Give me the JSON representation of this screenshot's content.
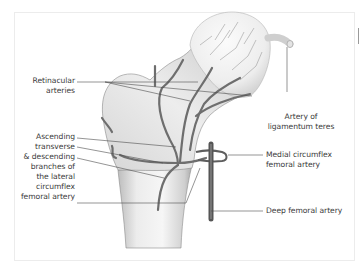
{
  "figure": {
    "labels": {
      "retinacular": [
        "Retinacular",
        "arteries"
      ],
      "ascending": "Ascending",
      "transverse": "transverse",
      "descending_block": [
        "& descending",
        "branches of",
        "the lateral",
        "circumflex"
      ],
      "lateral_circumflex_last": "femoral artery",
      "ligamentum_teres": [
        "Artery of",
        "ligamentum teres"
      ],
      "medial_circumflex": [
        "Medial circumflex",
        "femoral artery"
      ],
      "deep_femoral": "Deep femoral artery"
    },
    "colors": {
      "bone_light": "#f2f2f2",
      "bone_shade": "#c4c4c4",
      "vessel": "#6e6e6e",
      "vessel_dark": "#4a4a4a",
      "leader_line": "#4d4d4d",
      "text": "#3a3a3a"
    }
  }
}
